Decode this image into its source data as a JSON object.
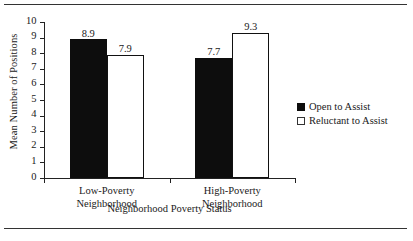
{
  "chart_data": {
    "type": "bar",
    "title": "",
    "xlabel": "Neighborhood Poverty Status",
    "ylabel": "Mean Number of Positions",
    "categories": [
      "Low-Poverty Neighborhood",
      "High-Poverty Neighborhood"
    ],
    "category_lines": [
      [
        "Low-Poverty",
        "Neighborhood"
      ],
      [
        "High-Poverty",
        "Neighborhood"
      ]
    ],
    "series": [
      {
        "name": "Open to Assist",
        "values": [
          8.9,
          7.7
        ],
        "value_labels": [
          "8.9",
          "7.7"
        ],
        "fill": "#0d0d0d",
        "style": "filled"
      },
      {
        "name": "Reluctant to Assist",
        "values": [
          7.9,
          9.3
        ],
        "value_labels": [
          "7.9",
          "9.3"
        ],
        "fill": "#ffffff",
        "style": "hollow"
      }
    ],
    "ylim": [
      0,
      10
    ],
    "ytick_step": 1,
    "ytick_labels": [
      "10",
      "9",
      "8",
      "7",
      "6",
      "5",
      "4",
      "3",
      "2",
      "1",
      "0"
    ],
    "grid": false,
    "legend_position": "right"
  },
  "legend": {
    "entries": [
      {
        "label": "Open to Assist",
        "swatch": "filled-square-icon"
      },
      {
        "label": "Reluctant to Assist",
        "swatch": "hollow-square-icon"
      }
    ]
  }
}
